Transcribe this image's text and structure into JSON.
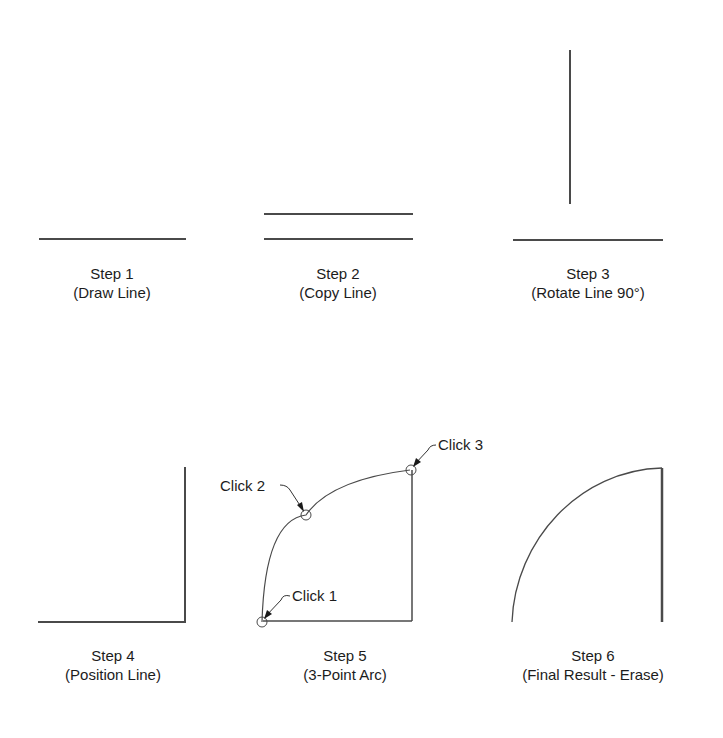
{
  "steps": [
    {
      "title": "Step 1",
      "subtitle": "(Draw Line)"
    },
    {
      "title": "Step 2",
      "subtitle": "(Copy Line)"
    },
    {
      "title": "Step 3",
      "subtitle": "(Rotate Line 90°)"
    },
    {
      "title": "Step 4",
      "subtitle": "(Position Line)"
    },
    {
      "title": "Step 5",
      "subtitle": "(3-Point Arc)"
    },
    {
      "title": "Step 6",
      "subtitle": "(Final Result - Erase)"
    }
  ],
  "callouts": {
    "click1": "Click 1",
    "click2": "Click 2",
    "click3": "Click 3"
  },
  "colors": {
    "line": "#4a4a4a",
    "text": "#1c1c1c",
    "background": "#ffffff"
  }
}
